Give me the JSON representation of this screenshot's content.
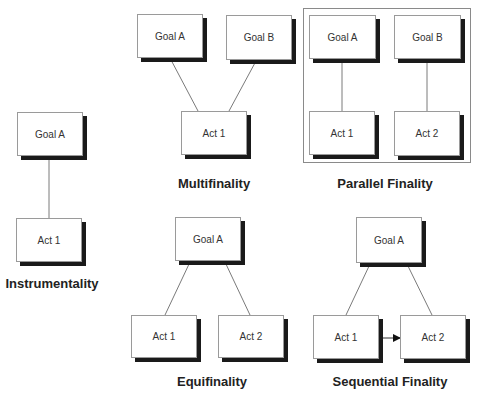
{
  "panels": {
    "instrumentality": {
      "title": "Instrumentality",
      "nodes": {
        "goal_a": "Goal A",
        "act_1": "Act 1"
      }
    },
    "multifinality": {
      "title": "Multifinality",
      "nodes": {
        "goal_a": "Goal A",
        "goal_b": "Goal B",
        "act_1": "Act 1"
      }
    },
    "parallel_finality": {
      "title": "Parallel Finality",
      "nodes": {
        "goal_a": "Goal A",
        "goal_b": "Goal B",
        "act_1": "Act 1",
        "act_2": "Act 2"
      }
    },
    "equifinality": {
      "title": "Equifinality",
      "nodes": {
        "goal_a": "Goal A",
        "act_1": "Act 1",
        "act_2": "Act 2"
      }
    },
    "sequential_finality": {
      "title": "Sequential Finality",
      "nodes": {
        "goal_a": "Goal A",
        "act_1": "Act 1",
        "act_2": "Act 2"
      }
    }
  },
  "colors": {
    "box_border": "#9a9a9a",
    "shadow": "#1a1a1a",
    "line": "#7a7a7a",
    "text": "#333333"
  }
}
